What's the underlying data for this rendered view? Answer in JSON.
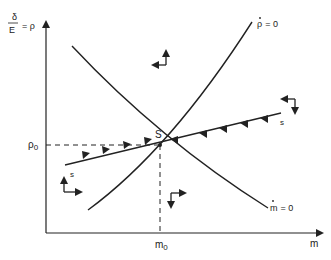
{
  "diagram": {
    "type": "phase-diagram",
    "y_axis": {
      "label_fraction_num": "δ",
      "label_fraction_den": "E",
      "label_suffix": "= ρ"
    },
    "x_axis": {
      "label": "m"
    },
    "equilibrium": {
      "label": "S"
    },
    "rho0_label": "ρ",
    "rho0_sub": "0",
    "m0_label": "m",
    "m0_sub": "0",
    "curves": [
      {
        "name": "rho-dot-zero",
        "label_dot": "ρ",
        "label_rest": "= 0"
      },
      {
        "name": "m-dot-zero",
        "label_dot": "m",
        "label_rest": "= 0"
      }
    ],
    "saddle_path_labels": [
      "s",
      "s"
    ]
  },
  "colors": {
    "ink": "#222222",
    "background": "#ffffff"
  }
}
